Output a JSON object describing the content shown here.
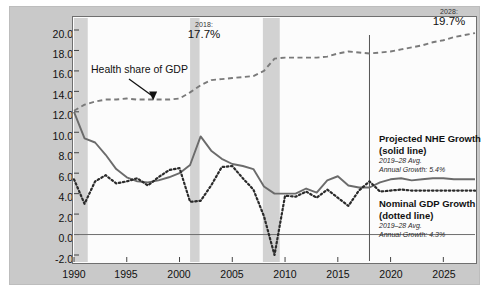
{
  "chart_data": {
    "type": "line",
    "title": "",
    "xlabel": "",
    "ylabel": "Percent (%)",
    "xlim": [
      1990,
      2028
    ],
    "ylim": [
      -2.0,
      21.0
    ],
    "grid": false,
    "legend_position": "inside-right",
    "x_ticks": [
      "1990",
      "1995",
      "2000",
      "2005",
      "2010",
      "2015",
      "2020",
      "2025"
    ],
    "x_tick_values": [
      1990,
      1995,
      2000,
      2005,
      2010,
      2015,
      2020,
      2025
    ],
    "y_ticks": [
      "20.0",
      "18.0",
      "16.0",
      "14.0",
      "12.0",
      "10.0",
      "8.0",
      "6.0",
      "4.0",
      "2.0",
      "0.0",
      "-2.0"
    ],
    "y_tick_values": [
      20.0,
      18.0,
      16.0,
      14.0,
      12.0,
      10.0,
      8.0,
      6.0,
      4.0,
      2.0,
      0.0,
      -2.0
    ],
    "x": [
      1990,
      1991,
      1992,
      1993,
      1994,
      1995,
      1996,
      1997,
      1998,
      1999,
      2000,
      2001,
      2002,
      2003,
      2004,
      2005,
      2006,
      2007,
      2008,
      2009,
      2010,
      2011,
      2012,
      2013,
      2014,
      2015,
      2016,
      2017,
      2018,
      2019,
      2020,
      2021,
      2022,
      2023,
      2024,
      2025,
      2026,
      2027,
      2028
    ],
    "series": [
      {
        "name": "Projected NHE Growth",
        "style": "solid",
        "color": "#6b6b6b",
        "values": [
          12.0,
          9.4,
          9.0,
          7.8,
          6.4,
          5.6,
          5.2,
          5.1,
          5.3,
          5.6,
          6.0,
          6.8,
          9.6,
          8.2,
          7.4,
          6.9,
          6.7,
          6.4,
          4.7,
          4.0,
          4.0,
          4.0,
          4.5,
          4.1,
          5.3,
          5.7,
          4.8,
          4.6,
          4.6,
          5.1,
          5.4,
          5.5,
          5.3,
          5.4,
          5.5,
          5.5,
          5.4,
          5.4,
          5.4
        ]
      },
      {
        "name": "Nominal GDP Growth",
        "style": "dotted",
        "color": "#2b2b2b",
        "values": [
          5.4,
          3.0,
          5.2,
          5.8,
          5.0,
          5.2,
          5.5,
          4.8,
          5.6,
          6.3,
          6.5,
          3.2,
          3.3,
          4.8,
          6.6,
          6.7,
          5.5,
          4.4,
          1.8,
          -2.0,
          3.8,
          3.7,
          4.2,
          3.6,
          4.4,
          3.6,
          2.8,
          4.3,
          5.2,
          4.2,
          4.3,
          4.4,
          4.3,
          4.3,
          4.3,
          4.3,
          4.3,
          4.3,
          4.3
        ]
      },
      {
        "name": "Health share of GDP",
        "style": "dashed",
        "color": "#7a7a7a",
        "values": [
          12.1,
          12.7,
          13.0,
          13.2,
          13.2,
          13.3,
          13.2,
          13.2,
          13.2,
          13.2,
          13.3,
          13.9,
          14.6,
          15.1,
          15.2,
          15.3,
          15.4,
          15.5,
          16.0,
          17.2,
          17.3,
          17.3,
          17.3,
          17.3,
          17.4,
          17.7,
          17.9,
          17.8,
          17.7,
          17.8,
          17.9,
          18.1,
          18.3,
          18.5,
          18.8,
          19.0,
          19.3,
          19.5,
          19.7
        ]
      }
    ],
    "recession_bands": [
      {
        "start": 1990.0,
        "end": 1991.3
      },
      {
        "start": 2001.0,
        "end": 2001.9
      },
      {
        "start": 2007.9,
        "end": 2009.5
      }
    ],
    "zero_line": 0.0,
    "vertical_marker": {
      "x": 2018,
      "label": ""
    },
    "annotations": [
      {
        "name": "health-share-callout",
        "text": "Health share of GDP",
        "points_to_x": 1997.5,
        "points_to_y": 13.2
      },
      {
        "name": "value-2018",
        "label": "2018:",
        "value": "17.7%"
      },
      {
        "name": "value-2028",
        "label": "2028:",
        "value": "19.7%"
      }
    ]
  },
  "axis": {
    "ylabel": "Percent (%)",
    "y_ticks": [
      "20.0",
      "18.0",
      "16.0",
      "14.0",
      "12.0",
      "10.0",
      "8.0",
      "6.0",
      "4.0",
      "2.0",
      "0.0",
      "-2.0"
    ],
    "x_ticks": [
      "1990",
      "1995",
      "2000",
      "2005",
      "2010",
      "2015",
      "2020",
      "2025"
    ]
  },
  "callouts": {
    "health_share": "Health share of GDP",
    "marker_2018_label": "2018:",
    "marker_2018_value": "17.7%",
    "marker_2028_label": "2028:",
    "marker_2028_value": "19.7%"
  },
  "legend": {
    "nhe": {
      "title": "Projected NHE Growth",
      "style": "(solid line)",
      "period": "2019–28 Avg.",
      "growth": "Annual Growth: 5.4%"
    },
    "gdp": {
      "title": "Nominal GDP Growth",
      "style": "(dotted line)",
      "period": "2019–28 Avg.",
      "growth": "Annual Growth: 4.3%"
    }
  },
  "colors": {
    "frame": "#c9c9c9",
    "panel": "#fcfcfc",
    "recession_band": "#d2d2d2",
    "nhe_line": "#6b6b6b",
    "gdp_line": "#2b2b2b",
    "health_line": "#7a7a7a"
  }
}
